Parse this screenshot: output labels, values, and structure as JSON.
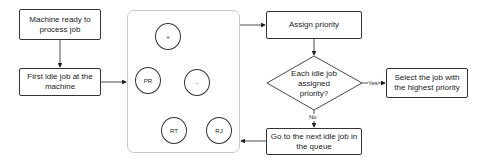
{
  "diagram": {
    "steps": {
      "machine_ready": "Machine ready to process job",
      "first_idle_job": "First idle job at the machine",
      "assign_priority": "Assign priority",
      "decision": "Each idle job assigned priority?",
      "select_job": "Select the job with the highest priority",
      "next_idle_job": "Go to the next idle job in the queue"
    },
    "tree": {
      "root": "+",
      "left": "PR",
      "right": "-",
      "right_left": "RT",
      "right_right": "RJ"
    },
    "edge_labels": {
      "yes": "Yes",
      "no": "No"
    }
  }
}
